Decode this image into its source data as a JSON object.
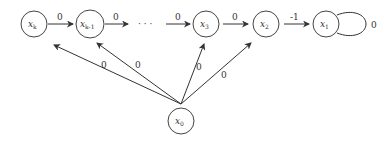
{
  "nodes": [
    {
      "id": "xk",
      "label": "x",
      "sub": "k"
    },
    {
      "id": "xk1",
      "label": "x",
      "sub": "k-1"
    },
    {
      "id": "x3",
      "label": "x",
      "sub": "3"
    },
    {
      "id": "x2",
      "label": "x",
      "sub": "2"
    },
    {
      "id": "x1",
      "label": "x",
      "sub": "1"
    },
    {
      "id": "x0",
      "label": "x",
      "sub": "0"
    }
  ],
  "ellipsis": "· · ·",
  "edges": [
    {
      "from": "xk",
      "to": "xk1",
      "weight": "0"
    },
    {
      "from": "xk1",
      "to": "dots",
      "weight": "0"
    },
    {
      "from": "dots",
      "to": "x3",
      "weight": "0"
    },
    {
      "from": "x3",
      "to": "x2",
      "weight": "0"
    },
    {
      "from": "x2",
      "to": "x1",
      "weight": "-1"
    },
    {
      "from": "x1",
      "to": "x1",
      "weight": "0"
    },
    {
      "from": "x0",
      "to": "xk",
      "weight": "0"
    },
    {
      "from": "x0",
      "to": "xk1",
      "weight": "0"
    },
    {
      "from": "x0",
      "to": "x3",
      "weight": "0"
    },
    {
      "from": "x0",
      "to": "x2",
      "weight": "0"
    }
  ]
}
